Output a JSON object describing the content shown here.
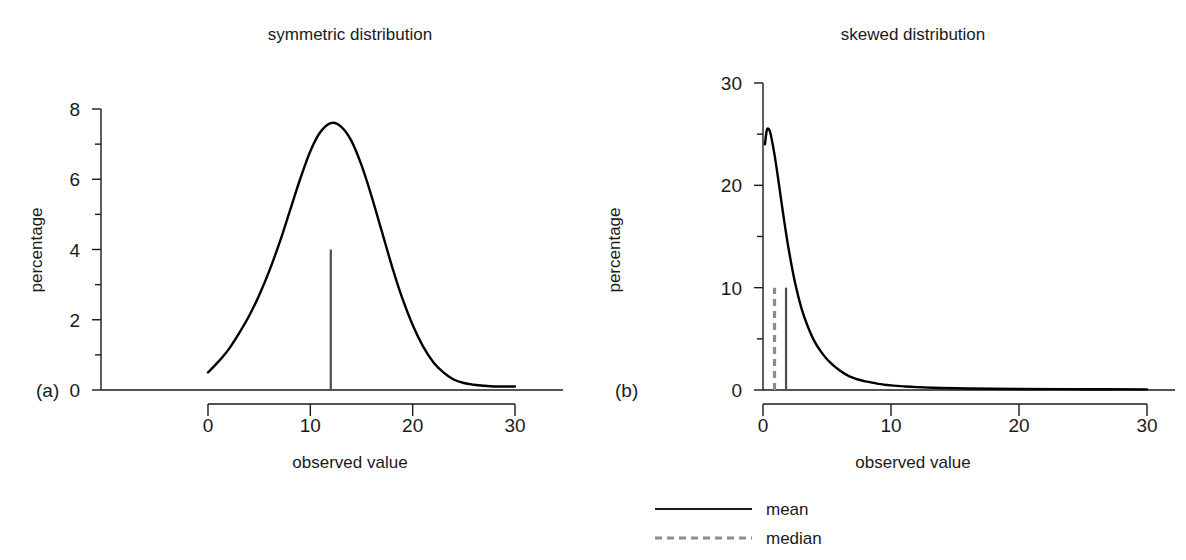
{
  "figure": {
    "width": 1186,
    "height": 560,
    "background": "#ffffff",
    "ink_color": "#1a1a1a",
    "median_color": "#8c8c8c"
  },
  "panels": [
    {
      "tag": "(a)",
      "title": "symmetric distribution",
      "xlabel": "observed value",
      "ylabel": "percentage"
    },
    {
      "tag": "(b)",
      "title": "skewed distribution",
      "xlabel": "observed value",
      "ylabel": "percentage"
    }
  ],
  "legend": {
    "position": "below-right-panel",
    "entries": [
      {
        "label": "mean",
        "style": "solid",
        "color": "#1a1a1a"
      },
      {
        "label": "median",
        "style": "dashed",
        "color": "#8c8c8c"
      }
    ]
  },
  "chart_data": [
    {
      "type": "line",
      "panel": "(a)",
      "title": "symmetric distribution",
      "xlabel": "observed value",
      "ylabel": "percentage",
      "xlim": [
        0,
        30
      ],
      "ylim": [
        0,
        8
      ],
      "xticks": [
        0,
        10,
        20,
        30
      ],
      "xticklabels": [
        "0",
        "10",
        "20",
        "30"
      ],
      "yticks": [
        0,
        2,
        4,
        6,
        8
      ],
      "yticklabels": [
        "0",
        "2",
        "4",
        "6",
        "8"
      ],
      "yminorticks": [
        1,
        3,
        5,
        7
      ],
      "grid": false,
      "series": [
        {
          "name": "symmetric density",
          "x": [
            0,
            1,
            2,
            3,
            4,
            5,
            6,
            7,
            8,
            9,
            10,
            11,
            12,
            13,
            14,
            15,
            16,
            17,
            18,
            19,
            20,
            21,
            22,
            23,
            24,
            25,
            26,
            27,
            28,
            29,
            30
          ],
          "y": [
            0.5,
            0.8,
            1.15,
            1.6,
            2.1,
            2.7,
            3.4,
            4.2,
            5.1,
            6.0,
            6.8,
            7.35,
            7.6,
            7.5,
            7.1,
            6.4,
            5.5,
            4.5,
            3.5,
            2.6,
            1.85,
            1.25,
            0.8,
            0.5,
            0.3,
            0.2,
            0.15,
            0.12,
            0.1,
            0.1,
            0.1
          ]
        }
      ],
      "annotations": [
        {
          "kind": "mean",
          "x": 12,
          "y_top": 4.0,
          "style": "solid"
        }
      ]
    },
    {
      "type": "line",
      "panel": "(b)",
      "title": "skewed distribution",
      "xlabel": "observed value",
      "ylabel": "percentage",
      "xlim": [
        0,
        30
      ],
      "ylim": [
        0,
        30
      ],
      "xticks": [
        0,
        10,
        20,
        30
      ],
      "xticklabels": [
        "0",
        "10",
        "20",
        "30"
      ],
      "yticks": [
        0,
        10,
        20,
        30
      ],
      "yticklabels": [
        "0",
        "10",
        "20",
        "30"
      ],
      "yminorticks": [
        5,
        15,
        25
      ],
      "grid": false,
      "series": [
        {
          "name": "skewed density",
          "x": [
            0.15,
            0.3,
            0.45,
            0.6,
            0.9,
            1.2,
            1.6,
            2.0,
            2.5,
            3.0,
            3.5,
            4.0,
            4.5,
            5.0,
            5.5,
            6.0,
            6.5,
            7.0,
            7.5,
            8.0,
            9.0,
            10.0,
            11.0,
            12.0,
            14.0,
            16.0,
            20.0,
            25.0,
            30.0
          ],
          "y": [
            24.0,
            25.4,
            25.5,
            25.0,
            23.0,
            20.5,
            17.0,
            13.8,
            10.5,
            8.0,
            6.2,
            4.8,
            3.8,
            3.0,
            2.4,
            1.9,
            1.5,
            1.2,
            1.0,
            0.85,
            0.6,
            0.45,
            0.35,
            0.28,
            0.2,
            0.15,
            0.1,
            0.08,
            0.06
          ]
        }
      ],
      "annotations": [
        {
          "kind": "median",
          "x": 0.9,
          "y_top": 10.0,
          "style": "dashed"
        },
        {
          "kind": "mean",
          "x": 1.8,
          "y_top": 10.0,
          "style": "solid"
        }
      ]
    }
  ]
}
